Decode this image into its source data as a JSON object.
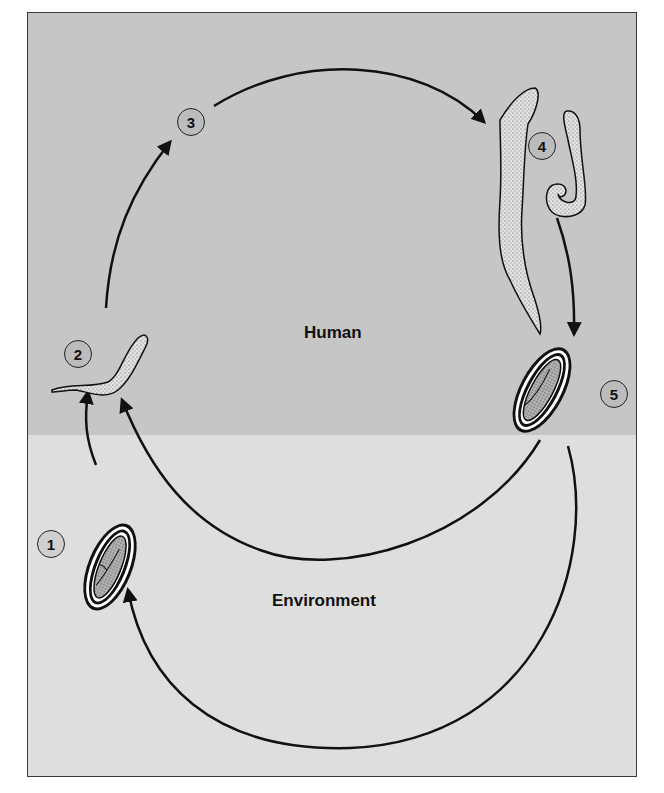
{
  "diagram": {
    "type": "life-cycle",
    "zones": {
      "human": {
        "label": "Human",
        "color": "#c6c6c6"
      },
      "environment": {
        "label": "Environment",
        "color": "#dedede"
      }
    },
    "stages": [
      {
        "number": "1",
        "name": "egg-in-environment"
      },
      {
        "number": "2",
        "name": "larva"
      },
      {
        "number": "3",
        "name": "transition-marker"
      },
      {
        "number": "4",
        "name": "adult-worms"
      },
      {
        "number": "5",
        "name": "egg-in-human"
      }
    ],
    "arrows": [
      {
        "from": "1",
        "to": "2"
      },
      {
        "from": "2",
        "to": "3"
      },
      {
        "from": "3",
        "to": "4"
      },
      {
        "from": "4",
        "to": "5"
      },
      {
        "from": "5",
        "to": "2"
      },
      {
        "from": "5",
        "to": "1"
      }
    ]
  }
}
